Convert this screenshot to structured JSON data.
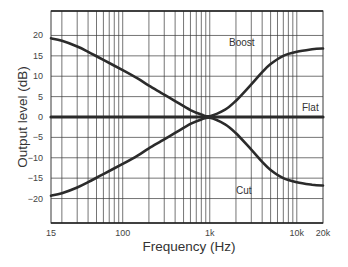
{
  "chart_data": {
    "type": "line",
    "title": "",
    "xlabel": "Frequency (Hz)",
    "ylabel": "Output level (dB)",
    "xscale": "log",
    "xlim": [
      15,
      20000
    ],
    "ylim": [
      -26,
      26
    ],
    "grid": true,
    "legend": "none (inline curve labels)",
    "x_tick_labels": [
      {
        "value": 15,
        "label": "15"
      },
      {
        "value": 100,
        "label": "100"
      },
      {
        "value": 1000,
        "label": "1k"
      },
      {
        "value": 10000,
        "label": "10k"
      },
      {
        "value": 20000,
        "label": "20k"
      }
    ],
    "y_ticks": [
      -20,
      -15,
      -10,
      -5,
      0,
      5,
      10,
      15,
      20
    ],
    "series": [
      {
        "name": "Boost",
        "x": [
          15,
          20,
          30,
          40,
          60,
          100,
          150,
          200,
          300,
          400,
          600,
          800,
          1000,
          1500,
          2000,
          3000,
          4000,
          5000,
          7000,
          10000,
          15000,
          20000
        ],
        "values": [
          19.3,
          18.7,
          17.3,
          16.0,
          14.0,
          11.5,
          9.4,
          7.7,
          5.5,
          3.9,
          1.7,
          0.6,
          0.2,
          1.8,
          4.0,
          8.0,
          11.0,
          13.0,
          15.0,
          16.0,
          16.6,
          16.8
        ]
      },
      {
        "name": "Flat",
        "x": [
          15,
          20000
        ],
        "values": [
          0,
          0
        ]
      },
      {
        "name": "Cut",
        "x": [
          15,
          20,
          30,
          40,
          60,
          100,
          150,
          200,
          300,
          400,
          600,
          800,
          1000,
          1500,
          2000,
          3000,
          4000,
          5000,
          7000,
          10000,
          15000,
          20000
        ],
        "values": [
          -19.3,
          -18.7,
          -17.3,
          -16.0,
          -14.0,
          -11.5,
          -9.4,
          -7.7,
          -5.5,
          -3.9,
          -1.7,
          -0.6,
          -0.2,
          -1.8,
          -4.0,
          -8.0,
          -11.0,
          -13.0,
          -15.0,
          -16.0,
          -16.6,
          -16.8
        ]
      }
    ],
    "annotations": [
      {
        "text": "Boost",
        "x": 2800,
        "y": 20.5
      },
      {
        "text": "Flat",
        "x": 15000,
        "y": 2.3
      },
      {
        "text": "Cut",
        "x": 2800,
        "y": -18.4
      }
    ]
  },
  "labels": {
    "xlabel": "Frequency (Hz)",
    "ylabel": "Output level (dB)",
    "boost": "Boost",
    "flat": "Flat",
    "cut": "Cut"
  },
  "colors": {
    "curve": "#2b2b2b",
    "grid": "#3a3a3a",
    "axis_text": "#444444"
  }
}
